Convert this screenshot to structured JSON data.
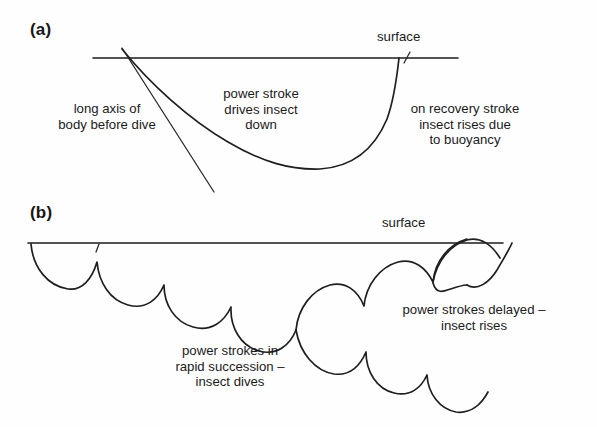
{
  "figure": {
    "panels": [
      {
        "id": "a",
        "label": "(a)",
        "surface_label": "surface",
        "annotations": [
          {
            "id": "long-axis",
            "lines": [
              "long axis of",
              "body before dive"
            ]
          },
          {
            "id": "power-stroke",
            "lines": [
              "power stroke",
              "drives insect",
              "down"
            ]
          },
          {
            "id": "recovery-stroke",
            "lines": [
              "on recovery stroke",
              "insect rises due",
              "to buoyancy"
            ]
          }
        ]
      },
      {
        "id": "b",
        "label": "(b)",
        "surface_label": "surface",
        "annotations": [
          {
            "id": "rapid-strokes",
            "lines": [
              "power strokes in",
              "rapid succession –",
              "insect dives"
            ]
          },
          {
            "id": "delayed-strokes",
            "lines": [
              "power strokes delayed –",
              "insect rises"
            ]
          }
        ]
      }
    ],
    "colors": {
      "background": "#fefefe",
      "ink": "#1c1c1c",
      "curve": "#1f1f1f"
    }
  }
}
